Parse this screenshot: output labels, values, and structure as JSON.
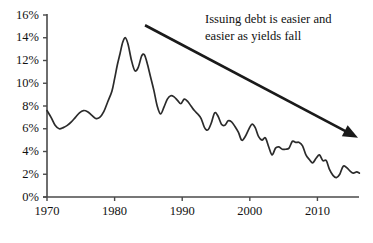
{
  "chart_data": {
    "type": "line",
    "title": "",
    "subtitle": "",
    "xlabel": "",
    "ylabel": "",
    "xlim": [
      1970,
      2016
    ],
    "ylim": [
      0,
      16
    ],
    "grid": false,
    "legend": "none",
    "y_tick_labels": [
      "0%",
      "2%",
      "4%",
      "6%",
      "8%",
      "10%",
      "12%",
      "14%",
      "16%"
    ],
    "y_tick_values": [
      0,
      2,
      4,
      6,
      8,
      10,
      12,
      14,
      16
    ],
    "x_tick_labels": [
      "1970",
      "1980",
      "1990",
      "2000",
      "2010"
    ],
    "x_tick_values": [
      1970,
      1980,
      1990,
      2000,
      2010
    ],
    "series": [
      {
        "name": "Yield",
        "color": "#2b2b2b",
        "x": [
          1970.0,
          1970.6,
          1971.2,
          1971.8,
          1972.4,
          1973.0,
          1973.6,
          1974.2,
          1974.8,
          1975.4,
          1976.0,
          1976.6,
          1977.2,
          1977.8,
          1978.4,
          1979.0,
          1979.6,
          1980.0,
          1980.4,
          1980.8,
          1981.2,
          1981.6,
          1982.0,
          1982.5,
          1983.0,
          1983.5,
          1984.0,
          1984.4,
          1984.8,
          1985.3,
          1985.8,
          1986.3,
          1986.8,
          1987.3,
          1987.8,
          1988.3,
          1988.8,
          1989.3,
          1989.8,
          1990.3,
          1990.8,
          1991.3,
          1991.8,
          1992.3,
          1992.8,
          1993.3,
          1993.8,
          1994.3,
          1994.8,
          1995.3,
          1995.8,
          1996.3,
          1996.8,
          1997.3,
          1997.8,
          1998.3,
          1998.8,
          1999.3,
          1999.8,
          2000.3,
          2000.8,
          2001.3,
          2001.8,
          2002.3,
          2002.8,
          2003.3,
          2003.8,
          2004.3,
          2004.8,
          2005.3,
          2005.8,
          2006.3,
          2006.8,
          2007.3,
          2007.8,
          2008.3,
          2008.8,
          2009.3,
          2009.8,
          2010.3,
          2010.8,
          2011.3,
          2011.8,
          2012.3,
          2012.8,
          2013.3,
          2013.8,
          2014.3,
          2014.8,
          2015.3,
          2015.8,
          2016.2
        ],
        "y": [
          7.6,
          7.0,
          6.3,
          6.0,
          6.1,
          6.3,
          6.6,
          7.0,
          7.4,
          7.6,
          7.5,
          7.2,
          6.9,
          7.0,
          7.5,
          8.4,
          9.3,
          10.4,
          11.6,
          12.6,
          13.6,
          14.0,
          13.4,
          12.0,
          11.1,
          11.4,
          12.4,
          12.5,
          11.8,
          10.6,
          9.4,
          8.0,
          7.3,
          7.9,
          8.6,
          8.9,
          8.8,
          8.5,
          8.2,
          8.6,
          8.4,
          8.0,
          7.6,
          7.3,
          6.9,
          6.1,
          5.9,
          6.5,
          7.4,
          7.1,
          6.4,
          6.3,
          6.7,
          6.6,
          6.2,
          5.7,
          5.0,
          5.3,
          5.9,
          6.4,
          6.1,
          5.3,
          5.0,
          5.2,
          4.4,
          3.7,
          4.3,
          4.4,
          4.2,
          4.2,
          4.3,
          4.9,
          4.8,
          4.8,
          4.5,
          3.7,
          3.3,
          3.0,
          3.4,
          3.7,
          3.2,
          3.2,
          2.4,
          1.9,
          1.7,
          2.0,
          2.7,
          2.6,
          2.3,
          2.1,
          2.2,
          2.1
        ]
      }
    ],
    "annotations": [
      {
        "name": "trend-annotation",
        "lines": [
          "Issuing debt is easier and",
          "easier as yields fall"
        ],
        "arrow": {
          "from": [
            1984.5,
            15.1
          ],
          "to": [
            2016.0,
            5.2
          ],
          "color": "#1a1a1a"
        }
      }
    ]
  },
  "axes": {
    "y_axis_color": "#4a4a4a",
    "x_axis_color": "#4a4a4a"
  }
}
